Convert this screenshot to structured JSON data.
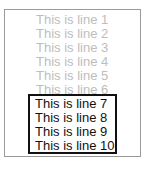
{
  "list": {
    "lines": [
      {
        "label": "This is line 1",
        "selected": false
      },
      {
        "label": "This is line 2",
        "selected": false
      },
      {
        "label": "This is line 3",
        "selected": false
      },
      {
        "label": "This is line 4",
        "selected": false
      },
      {
        "label": "This is line 5",
        "selected": false
      },
      {
        "label": "This is line 6",
        "selected": false
      },
      {
        "label": "This is line 7",
        "selected": true
      },
      {
        "label": "This is line 8",
        "selected": true
      },
      {
        "label": "This is line 9",
        "selected": true
      },
      {
        "label": "This is line 10",
        "selected": true
      }
    ]
  },
  "colors": {
    "faded_text": "#bdbdbd",
    "selected_text": "#111111",
    "outer_border": "#9a9a9a",
    "selection_border": "#111111"
  }
}
